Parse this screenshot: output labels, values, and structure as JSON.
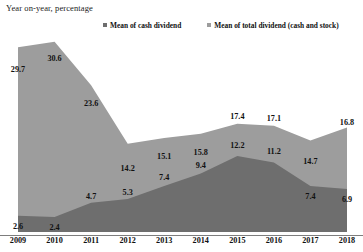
{
  "chart_data": {
    "type": "area",
    "title": "Year on-year, percentage",
    "xlabel": "",
    "ylabel": "",
    "ylim": [
      0,
      32
    ],
    "grid": false,
    "legend_position": "top",
    "stacked": false,
    "categories": [
      "2009",
      "2010",
      "2011",
      "2012",
      "2013",
      "2014",
      "2015",
      "2016",
      "2017",
      "2018"
    ],
    "series": [
      {
        "name": "Mean of total dividend (cash and stock)",
        "color": "#9d9d9d",
        "values": [
          29.7,
          30.6,
          23.6,
          14.2,
          15.1,
          15.8,
          17.4,
          17.1,
          14.7,
          16.8
        ]
      },
      {
        "name": "Mean of cash dividend",
        "color": "#6e6e6e",
        "values": [
          2.6,
          2.4,
          4.7,
          5.3,
          7.4,
          9.4,
          12.2,
          11.2,
          7.4,
          6.9
        ]
      }
    ]
  },
  "legend": {
    "items": [
      {
        "label": "Mean of cash dividend",
        "color": "#6e6e6e"
      },
      {
        "label": "Mean of total dividend (cash and stock)",
        "color": "#9d9d9d"
      }
    ]
  },
  "colors": {
    "total_dividend": "#9d9d9d",
    "cash_dividend": "#6e6e6e",
    "axis": "#7d7d7d",
    "text": "#111111"
  }
}
